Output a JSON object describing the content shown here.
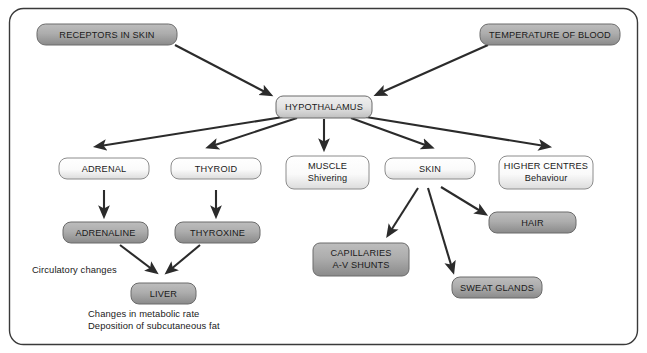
{
  "diagram": {
    "frame": {
      "border_color": "#3a3a3a",
      "background": "#ffffff",
      "corner_radius": 14
    },
    "palette": {
      "dark_box_fill_top": "#b4b4b4",
      "dark_box_fill_bottom": "#8e8e8e",
      "light_box_fill_top": "#ffffff",
      "light_box_fill_bottom": "#e2e2e2",
      "mid_box_fill_top": "#e8e8e8",
      "mid_box_fill_bottom": "#c4c4c4",
      "box_stroke": "#6b6b6b",
      "arrow_color": "#2b2b2b",
      "text_color": "#1a1a1a"
    },
    "nodes": [
      {
        "id": "receptors",
        "label": "RECEPTORS IN SKIN",
        "style": "dark"
      },
      {
        "id": "temperature",
        "label": "TEMPERATURE OF BLOOD",
        "style": "dark"
      },
      {
        "id": "hypothalamus",
        "label": "HYPOTHALAMUS",
        "style": "mid"
      },
      {
        "id": "adrenal",
        "label": "ADRENAL",
        "style": "light"
      },
      {
        "id": "thyroid",
        "label": "THYROID",
        "style": "light"
      },
      {
        "id": "muscle",
        "label": "MUSCLE",
        "label2": "Shivering",
        "style": "light"
      },
      {
        "id": "skin",
        "label": "SKIN",
        "style": "light"
      },
      {
        "id": "higher",
        "label": "HIGHER CENTRES",
        "label2": "Behaviour",
        "style": "light"
      },
      {
        "id": "adrenaline",
        "label": "ADRENALINE",
        "style": "dark"
      },
      {
        "id": "thyroxine",
        "label": "THYROXINE",
        "style": "dark"
      },
      {
        "id": "liver",
        "label": "LIVER",
        "style": "dark"
      },
      {
        "id": "capillaries",
        "label": "CAPILLARIES",
        "label2": "A-V SHUNTS",
        "style": "dark"
      },
      {
        "id": "hair",
        "label": "HAIR",
        "style": "dark"
      },
      {
        "id": "sweat",
        "label": "SWEAT GLANDS",
        "style": "dark"
      }
    ],
    "annotations": [
      {
        "id": "circulatory",
        "text": "Circulatory changes"
      },
      {
        "id": "metabolic-rate",
        "text": "Changes in metabolic rate"
      },
      {
        "id": "subcut-fat",
        "text": "Deposition of subcutaneous fat"
      }
    ],
    "edges": [
      {
        "from": "receptors",
        "to": "hypothalamus"
      },
      {
        "from": "temperature",
        "to": "hypothalamus"
      },
      {
        "from": "hypothalamus",
        "to": "adrenal"
      },
      {
        "from": "hypothalamus",
        "to": "thyroid"
      },
      {
        "from": "hypothalamus",
        "to": "muscle"
      },
      {
        "from": "hypothalamus",
        "to": "skin"
      },
      {
        "from": "hypothalamus",
        "to": "higher"
      },
      {
        "from": "adrenal",
        "to": "adrenaline"
      },
      {
        "from": "thyroid",
        "to": "thyroxine"
      },
      {
        "from": "adrenaline",
        "to": "liver"
      },
      {
        "from": "thyroxine",
        "to": "liver"
      },
      {
        "from": "skin",
        "to": "capillaries"
      },
      {
        "from": "skin",
        "to": "sweat"
      },
      {
        "from": "skin",
        "to": "hair"
      }
    ]
  }
}
